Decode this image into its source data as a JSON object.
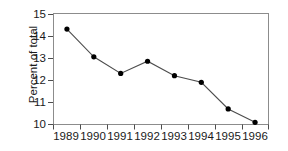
{
  "chart_data": {
    "type": "line",
    "title": "",
    "subtitle": "",
    "xlabel": "",
    "ylabel": "Percent of total",
    "categories": [
      "1989",
      "1990",
      "1991",
      "1992",
      "1993",
      "1994",
      "1995",
      "1996"
    ],
    "x": [
      1989,
      1990,
      1991,
      1992,
      1993,
      1994,
      1995,
      1996
    ],
    "values": [
      14.3,
      13.05,
      12.3,
      12.85,
      12.2,
      11.9,
      10.7,
      10.1
    ],
    "series": [
      {
        "name": "Percent of total",
        "values": [
          14.3,
          13.05,
          12.3,
          12.85,
          12.2,
          11.9,
          10.7,
          10.1
        ],
        "color": "#000000",
        "marker": "filled-circle",
        "line_style": "solid"
      }
    ],
    "ylim": [
      10,
      15
    ],
    "xlim_categories": [
      0,
      8
    ],
    "yticks": [
      10,
      11,
      12,
      13,
      14,
      15
    ],
    "ytick_labels": [
      "10",
      "11",
      "12",
      "13",
      "14",
      "15"
    ],
    "xtick_labels": [
      "1989",
      "1990",
      "1991",
      "1992",
      "1993",
      "1994",
      "1995",
      "1996"
    ],
    "grid": false,
    "legend": false,
    "legend_position": "none",
    "annotations": [],
    "frame_color": "#8c8c8c",
    "background_color": "#ffffff",
    "marker_color": "#000000",
    "line_color": "#4d4d4d"
  },
  "axis": {
    "y_label": "Percent of total",
    "y_ticks": [
      "15",
      "14",
      "13",
      "12",
      "11",
      "10"
    ],
    "x_ticks": [
      "1989",
      "1990",
      "1991",
      "1992",
      "1993",
      "1994",
      "1995",
      "1996"
    ]
  }
}
